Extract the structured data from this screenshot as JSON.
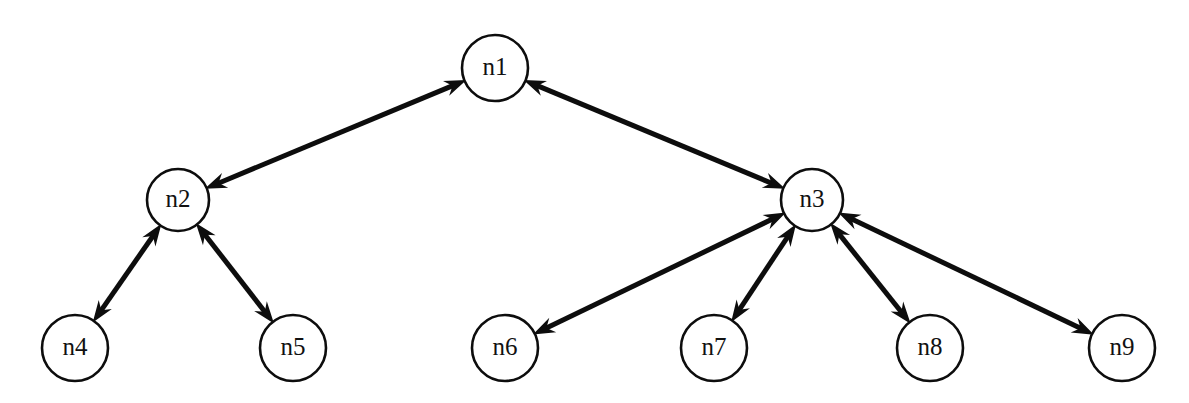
{
  "diagram": {
    "type": "node-link-graph",
    "canvas": {
      "width": 1189,
      "height": 403
    },
    "style": {
      "background_color": "#ffffff",
      "node_fill": "#ffffff",
      "node_stroke": "#0d0d0d",
      "edge_color": "#0d0d0d",
      "label_color": "#111111",
      "node_radius": 32,
      "edge_width": 5,
      "arrow_length": 22,
      "arrow_half_width": 8
    },
    "nodes": [
      {
        "id": "n1",
        "label": "n1",
        "x": 495,
        "y": 68,
        "r": 33
      },
      {
        "id": "n2",
        "label": "n2",
        "x": 178,
        "y": 200,
        "r": 31
      },
      {
        "id": "n3",
        "label": "n3",
        "x": 812,
        "y": 200,
        "r": 31
      },
      {
        "id": "n4",
        "label": "n4",
        "x": 75,
        "y": 348,
        "r": 33
      },
      {
        "id": "n5",
        "label": "n5",
        "x": 293,
        "y": 348,
        "r": 33
      },
      {
        "id": "n6",
        "label": "n6",
        "x": 505,
        "y": 348,
        "r": 33
      },
      {
        "id": "n7",
        "label": "n7",
        "x": 714,
        "y": 348,
        "r": 33
      },
      {
        "id": "n8",
        "label": "n8",
        "x": 930,
        "y": 348,
        "r": 33
      },
      {
        "id": "n9",
        "label": "n9",
        "x": 1122,
        "y": 348,
        "r": 33
      }
    ],
    "edges": [
      {
        "id": "e-n1-n2",
        "source": "n1",
        "target": "n2",
        "arrows": "both"
      },
      {
        "id": "e-n1-n3",
        "source": "n1",
        "target": "n3",
        "arrows": "both"
      },
      {
        "id": "e-n2-n4",
        "source": "n2",
        "target": "n4",
        "arrows": "both"
      },
      {
        "id": "e-n2-n5",
        "source": "n2",
        "target": "n5",
        "arrows": "both"
      },
      {
        "id": "e-n3-n6",
        "source": "n3",
        "target": "n6",
        "arrows": "both"
      },
      {
        "id": "e-n3-n7",
        "source": "n3",
        "target": "n7",
        "arrows": "both"
      },
      {
        "id": "e-n3-n8",
        "source": "n3",
        "target": "n8",
        "arrows": "both"
      },
      {
        "id": "e-n3-n9",
        "source": "n3",
        "target": "n9",
        "arrows": "both"
      }
    ]
  }
}
